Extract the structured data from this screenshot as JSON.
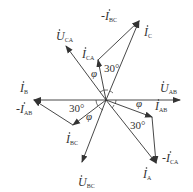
{
  "diagram": {
    "type": "phasor-diagram",
    "origin": [
      106,
      100
    ],
    "color": "#333333",
    "phasors": [
      {
        "name": "U_AB",
        "label": "U",
        "sub": "AB",
        "dot": true,
        "from": [
          106,
          100
        ],
        "to": [
          180,
          100
        ],
        "label_pos": [
          160,
          92
        ]
      },
      {
        "name": "U_CA",
        "label": "U",
        "sub": "CA",
        "dot": true,
        "from": [
          106,
          100
        ],
        "to": [
          66,
          46
        ],
        "label_pos": [
          56,
          40
        ]
      },
      {
        "name": "U_BC",
        "label": "U",
        "sub": "BC",
        "dot": true,
        "from": [
          106,
          100
        ],
        "to": [
          82,
          162
        ],
        "label_pos": [
          78,
          186
        ]
      },
      {
        "name": "I_C",
        "label": "I",
        "sub": "C",
        "dot": true,
        "from": [
          106,
          100
        ],
        "to": [
          139,
          21
        ],
        "label_pos": [
          144,
          36
        ]
      },
      {
        "name": "I_CA",
        "label": "I",
        "sub": "CA",
        "dot": true,
        "from": [
          106,
          100
        ],
        "to": [
          98,
          60
        ],
        "label_pos": [
          82,
          58
        ]
      },
      {
        "name": "-I_BC",
        "label": "-I",
        "sub": "BC",
        "dot": true,
        "from": [
          98,
          60
        ],
        "to": [
          139,
          21
        ],
        "label_pos": [
          101,
          20
        ]
      },
      {
        "name": "I_B",
        "label": "I",
        "sub": "B",
        "dot": true,
        "from": [
          106,
          100
        ],
        "to": [
          34,
          100
        ],
        "label_pos": [
          20,
          92
        ]
      },
      {
        "name": "I_BC",
        "label": "I",
        "sub": "BC",
        "dot": true,
        "from": [
          106,
          100
        ],
        "to": [
          73,
          125
        ],
        "label_pos": [
          66,
          143
        ]
      },
      {
        "name": "-I_AB",
        "label": "-I",
        "sub": "AB",
        "dot": true,
        "from": [
          73,
          125
        ],
        "to": [
          34,
          100
        ],
        "label_pos": [
          16,
          113
        ]
      },
      {
        "name": "I_AB",
        "label": "I",
        "sub": "AB",
        "dot": true,
        "from": [
          106,
          100
        ],
        "to": [
          152,
          117
        ],
        "label_pos": [
          155,
          110
        ]
      },
      {
        "name": "I_A",
        "label": "I",
        "sub": "A",
        "dot": true,
        "from": [
          106,
          100
        ],
        "to": [
          156,
          163
        ],
        "label_pos": [
          143,
          178
        ]
      },
      {
        "name": "-I_CA",
        "label": "-I",
        "sub": "CA",
        "dot": true,
        "from": [
          152,
          117
        ],
        "to": [
          156,
          163
        ],
        "label_pos": [
          162,
          162
        ]
      }
    ],
    "angle_labels": [
      {
        "text": "30°",
        "pos": [
          104,
          72
        ]
      },
      {
        "text": "φ",
        "pos": [
          91,
          77
        ]
      },
      {
        "text": "30°",
        "pos": [
          69,
          112
        ]
      },
      {
        "text": "φ",
        "pos": [
          86,
          120
        ]
      },
      {
        "text": "φ",
        "pos": [
          136,
          107
        ]
      },
      {
        "text": "30°",
        "pos": [
          130,
          129
        ]
      }
    ]
  }
}
